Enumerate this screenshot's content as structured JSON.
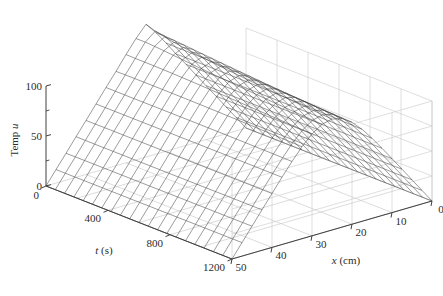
{
  "figure": {
    "type": "surface-mesh-3d",
    "background_color": "#ffffff",
    "mesh_color": "#3a3a3a",
    "grid_color": "#c8c8c8",
    "axis_color": "#404040",
    "text_color": "#2b2b2b"
  },
  "axes": {
    "z": {
      "label": "Temp u",
      "label_plain": "Temp ",
      "label_italic": "u",
      "ticks": [
        0,
        50,
        100
      ],
      "tick_labels": [
        "0",
        "50",
        "100"
      ],
      "minor_ticks": [
        25,
        75
      ],
      "range": [
        0,
        100
      ]
    },
    "t": {
      "label_italic": "t",
      "label_plain": " (s)",
      "label": "t (s)",
      "ticks": [
        0,
        400,
        800,
        1200
      ],
      "tick_labels": [
        "0",
        "400",
        "800",
        "1200"
      ],
      "range": [
        0,
        1200
      ],
      "units": "s"
    },
    "x": {
      "label_italic": "x",
      "label_plain": " (cm)",
      "label": "x (cm)",
      "ticks": [
        0,
        10,
        20,
        30,
        40,
        50
      ],
      "tick_labels": [
        "0",
        "10",
        "20",
        "30",
        "40",
        "50"
      ],
      "range": [
        0,
        50
      ],
      "units": "cm"
    }
  },
  "chart_data": {
    "type": "surface",
    "title": "",
    "xlabel": "x (cm)",
    "ylabel": "t (s)",
    "zlabel": "Temp u",
    "xlim": [
      0,
      50
    ],
    "ylim": [
      0,
      1200
    ],
    "zlim": [
      0,
      100
    ],
    "grid": true,
    "legend": null,
    "surface_model": {
      "kind": "heat-diffusion-separable",
      "length_cm": 50,
      "peak_position_cm": 25,
      "peak_amplitude": 135,
      "diffusivity": 0.00042,
      "n_modes": 24,
      "boundary_condition": "u(0,t)=u(50,t)=0",
      "initial_condition": "triangular spike centered at x=25"
    },
    "mesh": {
      "x_divisions": 20,
      "t_divisions": 20
    },
    "sampled_profiles": [
      {
        "t": 0,
        "x": [
          0,
          5,
          10,
          15,
          20,
          25,
          30,
          35,
          40,
          45,
          50
        ],
        "u": [
          0,
          27,
          54,
          81,
          108,
          135,
          108,
          81,
          54,
          27,
          0
        ]
      },
      {
        "t": 120,
        "x": [
          0,
          5,
          10,
          15,
          20,
          25,
          30,
          35,
          40,
          45,
          50
        ],
        "u": [
          0,
          16,
          32,
          47,
          58,
          63,
          58,
          47,
          32,
          16,
          0
        ]
      },
      {
        "t": 300,
        "x": [
          0,
          5,
          10,
          15,
          20,
          25,
          30,
          35,
          40,
          45,
          50
        ],
        "u": [
          0,
          11,
          21,
          30,
          36,
          38,
          36,
          30,
          21,
          11,
          0
        ]
      },
      {
        "t": 600,
        "x": [
          0,
          5,
          10,
          15,
          20,
          25,
          30,
          35,
          40,
          45,
          50
        ],
        "u": [
          0,
          6,
          12,
          17,
          20,
          21,
          20,
          17,
          12,
          6,
          0
        ]
      },
      {
        "t": 900,
        "x": [
          0,
          5,
          10,
          15,
          20,
          25,
          30,
          35,
          40,
          45,
          50
        ],
        "u": [
          0,
          4,
          7,
          10,
          12,
          12,
          12,
          10,
          7,
          4,
          0
        ]
      },
      {
        "t": 1200,
        "x": [
          0,
          5,
          10,
          15,
          20,
          25,
          30,
          35,
          40,
          45,
          50
        ],
        "u": [
          0,
          2,
          4,
          6,
          7,
          7,
          7,
          6,
          4,
          2,
          0
        ]
      }
    ]
  }
}
